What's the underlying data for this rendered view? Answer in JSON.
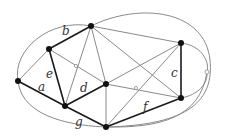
{
  "diagram": {
    "type": "planar-graph",
    "colors": {
      "thin_edge": "#8a8a8a",
      "thick_edge": "#1a1a1a",
      "node": "#111111",
      "label": "#333333"
    },
    "nodes": [
      {
        "id": "n1",
        "x": 18,
        "y": 81
      },
      {
        "id": "n2",
        "x": 49,
        "y": 49
      },
      {
        "id": "n3",
        "x": 91,
        "y": 26
      },
      {
        "id": "n4",
        "x": 181,
        "y": 43
      },
      {
        "id": "n5",
        "x": 106,
        "y": 84
      },
      {
        "id": "n6",
        "x": 65,
        "y": 106
      },
      {
        "id": "n7",
        "x": 106,
        "y": 127
      },
      {
        "id": "n8",
        "x": 181,
        "y": 98
      }
    ],
    "labels": {
      "a": "a",
      "b": "b",
      "c": "c",
      "d": "d",
      "e": "e",
      "f": "f",
      "g": "g"
    }
  }
}
